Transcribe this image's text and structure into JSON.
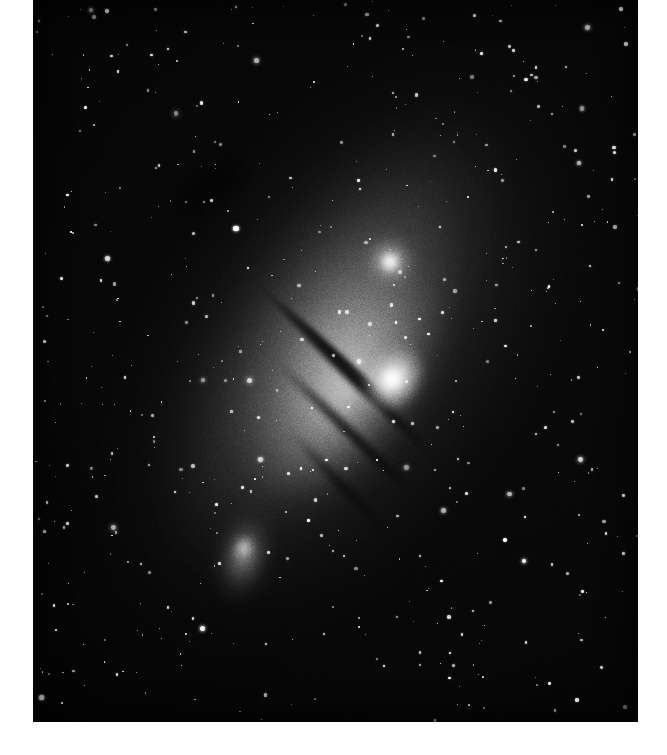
{
  "page": {
    "background_color": "#ffffff",
    "kind": "astronomical-photograph-plate"
  },
  "plate": {
    "label": "",
    "frame": {
      "x": 33,
      "y": 0,
      "width": 605,
      "height": 722
    },
    "background_color": "#000000",
    "medium": "black-and-white photographic plate",
    "grain": {
      "opacity": 0.55,
      "description": "heavy photographic emulsion grain"
    }
  },
  "objects": [
    {
      "name": "andromeda-galaxy-disc",
      "label": "",
      "kind": "spiral-galaxy",
      "center": {
        "x": 310,
        "y": 350
      },
      "major_axis_px": 760,
      "minor_axis_px": 430,
      "position_angle_deg": -57,
      "peak_brightness": "#ffffff",
      "halo_color": "#565656"
    },
    {
      "name": "andromeda-nucleus",
      "label": "",
      "kind": "galactic-nucleus",
      "center": {
        "x": 358,
        "y": 379
      },
      "width_px": 78,
      "height_px": 62,
      "position_angle_deg": -52,
      "peak_brightness": "#ffffff"
    },
    {
      "name": "companion-galaxy-round",
      "label": "",
      "kind": "elliptical-companion-galaxy",
      "center": {
        "x": 357,
        "y": 261
      },
      "width_px": 66,
      "height_px": 62,
      "position_angle_deg": 0,
      "peak_brightness": "#ffffff"
    },
    {
      "name": "companion-galaxy-elongated",
      "label": "",
      "kind": "elliptical-companion-galaxy",
      "center": {
        "x": 209,
        "y": 563
      },
      "width_px": 62,
      "height_px": 116,
      "position_angle_deg": 14,
      "peak_brightness": "#f2f2f2"
    }
  ],
  "dust_lanes": [
    {
      "name": "dust-lane-1",
      "start": {
        "x": 222,
        "y": 276
      },
      "length_px": 210,
      "angle_deg": 42,
      "thickness_px": 13,
      "opacity": 0.92
    },
    {
      "name": "dust-lane-2",
      "start": {
        "x": 241,
        "y": 293
      },
      "length_px": 235,
      "angle_deg": 44,
      "thickness_px": 17,
      "opacity": 0.95
    },
    {
      "name": "dust-lane-3",
      "start": {
        "x": 234,
        "y": 345
      },
      "length_px": 215,
      "angle_deg": 44,
      "thickness_px": 15,
      "opacity": 0.9
    },
    {
      "name": "dust-lane-4",
      "start": {
        "x": 252,
        "y": 420
      },
      "length_px": 160,
      "angle_deg": 46,
      "thickness_px": 13,
      "opacity": 0.72
    }
  ],
  "starfield": {
    "count": 560,
    "color": "#ffffff",
    "size_range_px": [
      1,
      4
    ],
    "note": "scattered foreground stars, denser to the left of the galaxy where sky is dark"
  },
  "colors": {
    "page": "#ffffff",
    "sky": "#000000",
    "sky_mid": "#070707",
    "galaxy_halo": "#565656",
    "galaxy_bulge": "#d7d7d7",
    "star": "#ffffff",
    "dust_lane": "#000000"
  }
}
